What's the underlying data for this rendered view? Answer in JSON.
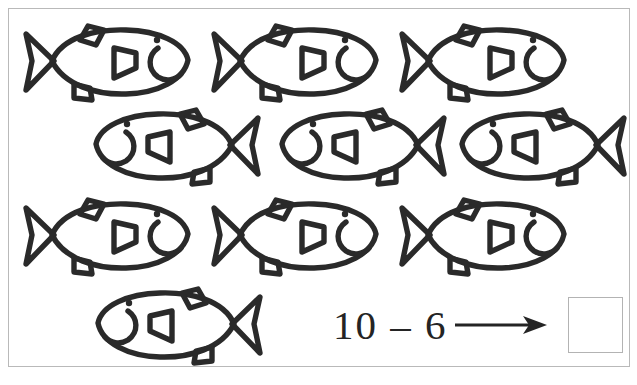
{
  "worksheet": {
    "title": "Subtraction picture worksheet",
    "frame_color": "#b9b9b9",
    "ink_color": "#2a2a2a",
    "paper_color": "#ffffff"
  },
  "equation": {
    "text": "10 – 6",
    "minuend": 10,
    "subtrahend": 6,
    "operator": "–",
    "arrow": "→",
    "answer_value": "",
    "answer_placeholder": ""
  },
  "fish_groups": [
    {
      "row": 1,
      "facing": "right",
      "count": 3,
      "items": [
        {
          "label": "fish",
          "x": 18,
          "y": 20
        },
        {
          "label": "fish",
          "x": 206,
          "y": 20
        },
        {
          "label": "fish",
          "x": 394,
          "y": 20
        }
      ]
    },
    {
      "row": 2,
      "facing": "left",
      "count": 3,
      "items": [
        {
          "label": "fish",
          "x": 86,
          "y": 104
        },
        {
          "label": "fish",
          "x": 272,
          "y": 104
        },
        {
          "label": "fish",
          "x": 452,
          "y": 104
        }
      ]
    },
    {
      "row": 3,
      "facing": "right",
      "count": 3,
      "items": [
        {
          "label": "fish",
          "x": 18,
          "y": 194
        },
        {
          "label": "fish",
          "x": 206,
          "y": 194
        },
        {
          "label": "fish",
          "x": 394,
          "y": 194
        }
      ]
    },
    {
      "row": 4,
      "facing": "left",
      "count": 1,
      "items": [
        {
          "label": "fish",
          "x": 88,
          "y": 283
        }
      ]
    }
  ],
  "totals": {
    "fish_total": 10
  }
}
